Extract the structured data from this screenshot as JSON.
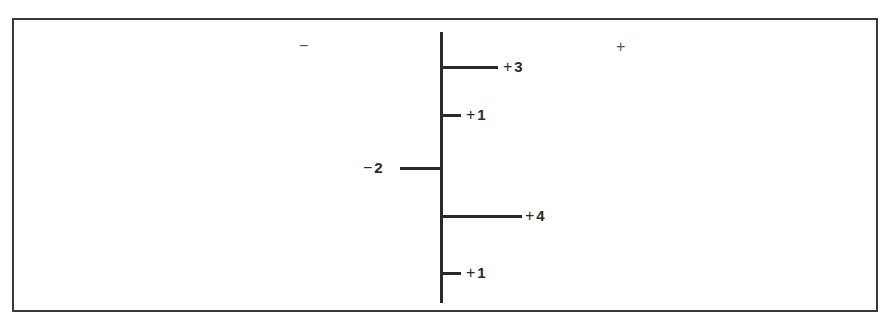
{
  "diagram": {
    "side_labels": {
      "negative": "−",
      "positive": "+"
    },
    "axis": {
      "orientation": "vertical"
    },
    "branches": [
      {
        "sign": "+",
        "value": "3",
        "direction": "right",
        "length": 56,
        "y": 67
      },
      {
        "sign": "+",
        "value": "1",
        "direction": "right",
        "length": 19,
        "y": 115
      },
      {
        "sign": "−",
        "value": "2",
        "direction": "left",
        "length": 41,
        "y": 168
      },
      {
        "sign": "+",
        "value": "4",
        "direction": "right",
        "length": 80,
        "y": 216
      },
      {
        "sign": "+",
        "value": "1",
        "direction": "right",
        "length": 19,
        "y": 273
      }
    ]
  },
  "colors": {
    "line": "#2a2a2a",
    "frame": "#3a3a3a",
    "background": "#ffffff"
  }
}
